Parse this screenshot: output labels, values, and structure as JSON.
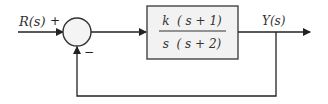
{
  "diagram": {
    "type": "feedback-control-block-diagram",
    "input_label": "R(s)",
    "output_label": "Y(s)",
    "summing_junction": {
      "plus_sign": "+",
      "minus_sign": "−"
    },
    "transfer_function": {
      "numerator": "k  ( s + 1)",
      "denominator": "s  ( s + 2)"
    },
    "feedback": "unity negative feedback",
    "colors": {
      "line": "#222222",
      "block_fill": "#f2f2f2",
      "block_border": "#444444",
      "junction_fill": "#f4f4f4"
    }
  }
}
